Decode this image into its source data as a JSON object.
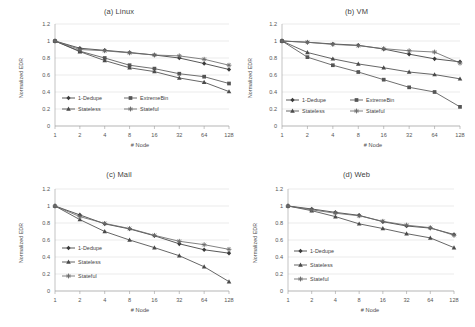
{
  "figure": {
    "background": "#ffffff",
    "ink": "#3b3b3b",
    "grid_color": "#d4d4d4",
    "axis_color": "#9a9a9a"
  },
  "axis_common": {
    "xlabel": "# Node",
    "ylabel": "Normalized EDR",
    "xticks": [
      "1",
      "2",
      "4",
      "8",
      "16",
      "32",
      "64",
      "128"
    ],
    "yticks": [
      "0",
      "0.2",
      "0.4",
      "0.6",
      "0.8",
      "1",
      "1.2"
    ]
  },
  "series_styles": {
    "1-Dedupe": {
      "color": "#3a3a3a",
      "marker": "diamond"
    },
    "ExtremeBin": {
      "color": "#555555",
      "marker": "square"
    },
    "Stateless": {
      "color": "#4a4a4a",
      "marker": "triangle"
    },
    "Stateful": {
      "color": "#6b6b6b",
      "marker": "cross"
    }
  },
  "chart_data": [
    {
      "type": "line",
      "id": "linux",
      "title": "(a) Linux",
      "xlabel": "# Node",
      "ylabel": "Normalized EDR",
      "x": [
        1,
        2,
        4,
        8,
        16,
        32,
        64,
        128
      ],
      "xtick_labels": [
        "1",
        "2",
        "4",
        "8",
        "16",
        "32",
        "64",
        "128"
      ],
      "xscale": "log2-categorical",
      "ylim": [
        0,
        1.2
      ],
      "yticks": [
        0,
        0.2,
        0.4,
        0.6,
        0.8,
        1,
        1.2
      ],
      "grid": "horizontal",
      "legend_position": "lower-left-inside",
      "legend_columns": 2,
      "series": [
        {
          "name": "1-Dedupe",
          "values": [
            1.0,
            0.915,
            0.89,
            0.865,
            0.835,
            0.8,
            0.735,
            0.665
          ]
        },
        {
          "name": "ExtremeBin",
          "values": [
            1.0,
            0.88,
            0.8,
            0.715,
            0.675,
            0.615,
            0.58,
            0.5
          ]
        },
        {
          "name": "Stateless",
          "values": [
            1.0,
            0.875,
            0.77,
            0.685,
            0.64,
            0.565,
            0.515,
            0.405
          ]
        },
        {
          "name": "Stateful",
          "values": [
            1.0,
            0.9,
            0.885,
            0.86,
            0.835,
            0.825,
            0.785,
            0.715
          ]
        }
      ]
    },
    {
      "type": "line",
      "id": "vm",
      "title": "(b) VM",
      "xlabel": "# Node",
      "ylabel": "Normalized EDR",
      "x": [
        1,
        2,
        4,
        8,
        16,
        32,
        64,
        128
      ],
      "xtick_labels": [
        "1",
        "2",
        "4",
        "8",
        "16",
        "32",
        "64",
        "128"
      ],
      "xscale": "log2-categorical",
      "ylim": [
        0,
        1.2
      ],
      "yticks": [
        0,
        0.2,
        0.4,
        0.6,
        0.8,
        1,
        1.2
      ],
      "grid": "horizontal",
      "legend_position": "lower-left-inside",
      "legend_columns": 2,
      "series": [
        {
          "name": "1-Dedupe",
          "values": [
            1.0,
            0.985,
            0.965,
            0.95,
            0.905,
            0.845,
            0.79,
            0.755
          ]
        },
        {
          "name": "ExtremeBin",
          "values": [
            1.0,
            0.81,
            0.715,
            0.635,
            0.545,
            0.455,
            0.4,
            0.225
          ]
        },
        {
          "name": "Stateless",
          "values": [
            1.0,
            0.865,
            0.79,
            0.73,
            0.685,
            0.635,
            0.605,
            0.555
          ]
        },
        {
          "name": "Stateful",
          "values": [
            1.0,
            0.985,
            0.96,
            0.945,
            0.91,
            0.885,
            0.87,
            0.74
          ]
        }
      ]
    },
    {
      "type": "line",
      "id": "mail",
      "title": "(c) Mail",
      "xlabel": "# Node",
      "ylabel": "Normalized EDR",
      "x": [
        1,
        2,
        4,
        8,
        16,
        32,
        64,
        128
      ],
      "xtick_labels": [
        "1",
        "2",
        "4",
        "8",
        "16",
        "32",
        "64",
        "128"
      ],
      "xscale": "log2-categorical",
      "ylim": [
        0,
        1.2
      ],
      "yticks": [
        0,
        0.2,
        0.4,
        0.6,
        0.8,
        1,
        1.2
      ],
      "grid": "horizontal",
      "legend_position": "lower-left-inside",
      "legend_columns": 1,
      "series": [
        {
          "name": "1-Dedupe",
          "values": [
            1.0,
            0.895,
            0.79,
            0.73,
            0.65,
            0.555,
            0.485,
            0.445
          ]
        },
        {
          "name": "Stateless",
          "values": [
            1.0,
            0.84,
            0.7,
            0.6,
            0.51,
            0.415,
            0.285,
            0.11
          ]
        },
        {
          "name": "Stateful",
          "values": [
            1.0,
            0.875,
            0.795,
            0.735,
            0.655,
            0.585,
            0.545,
            0.49
          ]
        }
      ]
    },
    {
      "type": "line",
      "id": "web",
      "title": "(d) Web",
      "xlabel": "# Node",
      "ylabel": "Normalized EDR",
      "x": [
        1,
        2,
        4,
        8,
        16,
        32,
        64,
        128
      ],
      "xtick_labels": [
        "1",
        "2",
        "4",
        "8",
        "16",
        "32",
        "64",
        "128"
      ],
      "xscale": "log2-categorical",
      "ylim": [
        0,
        1.2
      ],
      "yticks": [
        0,
        0.2,
        0.4,
        0.6,
        0.8,
        1,
        1.2
      ],
      "grid": "horizontal",
      "legend_position": "lower-left-inside",
      "legend_columns": 1,
      "series": [
        {
          "name": "1-Dedupe",
          "values": [
            1.0,
            0.965,
            0.925,
            0.89,
            0.815,
            0.765,
            0.74,
            0.665
          ]
        },
        {
          "name": "Stateless",
          "values": [
            1.0,
            0.945,
            0.875,
            0.79,
            0.735,
            0.675,
            0.625,
            0.51
          ]
        },
        {
          "name": "Stateful",
          "values": [
            1.0,
            0.955,
            0.915,
            0.885,
            0.82,
            0.775,
            0.745,
            0.655
          ]
        }
      ]
    }
  ]
}
